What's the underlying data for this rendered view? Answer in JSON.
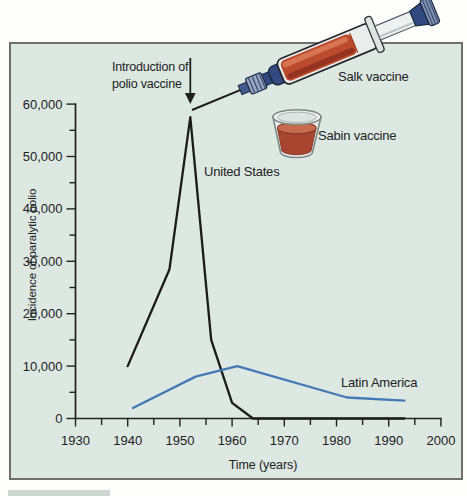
{
  "figure": {
    "illustrations": {
      "salk_label": "Salk vaccine",
      "sabin_label": "Sabin vaccine"
    },
    "colors": {
      "panel_bg": "#dde8e2",
      "panel_border": "#6f6f6f",
      "us_line": "#1b1b19",
      "latin_america_line": "#4579b5",
      "vaccine_liquid_red": "#bc4a2e",
      "syringe_navy": "#31497e"
    }
  },
  "chart_data": {
    "type": "line",
    "title": "",
    "xlabel": "Time (years)",
    "ylabel": "Incidence of paralytic polio",
    "xlim": [
      1930,
      2000
    ],
    "ylim": [
      0,
      60000
    ],
    "grid": false,
    "x_ticks": [
      1930,
      1940,
      1950,
      1960,
      1970,
      1980,
      1990,
      2000
    ],
    "x_tick_labels": [
      "1930",
      "1940",
      "1950",
      "1960",
      "1970",
      "1980",
      "1990",
      "2000"
    ],
    "x_minor_tick_step": 5,
    "y_ticks": [
      0,
      10000,
      20000,
      30000,
      40000,
      50000,
      60000
    ],
    "y_tick_labels": [
      "0",
      "10,000",
      "20,000",
      "30,000",
      "40,000",
      "50,000",
      "60,000"
    ],
    "y_minor_tick_step": 5000,
    "annotation": {
      "lines": [
        "Introduction of",
        "polio vaccine"
      ],
      "arrow_year": 1952
    },
    "series": [
      {
        "name": "United States",
        "color": "#1b1b19",
        "points": [
          [
            1940,
            10000
          ],
          [
            1948,
            28500
          ],
          [
            1952,
            57500
          ],
          [
            1956,
            15000
          ],
          [
            1960,
            3000
          ],
          [
            1964,
            0
          ],
          [
            1993,
            0
          ]
        ]
      },
      {
        "name": "Latin America",
        "color": "#4579b5",
        "points": [
          [
            1941,
            2000
          ],
          [
            1953,
            8000
          ],
          [
            1961,
            10000
          ],
          [
            1982,
            4000
          ],
          [
            1993,
            3400
          ]
        ]
      }
    ]
  }
}
